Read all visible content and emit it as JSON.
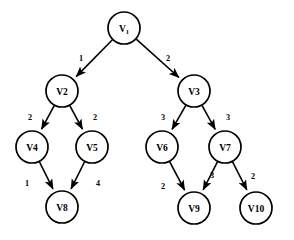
{
  "diagram": {
    "background_color": "#ffffff",
    "stroke_color": "#000000",
    "node_fill_color": "#ffffff",
    "node_radius": 16
  },
  "nodes": [
    {
      "id": "V1",
      "label": "V",
      "subscript": "1",
      "display": "V1",
      "cx": 124,
      "cy": 28,
      "r": 16
    },
    {
      "id": "V2",
      "label": "V2",
      "subscript": "",
      "display": "V2",
      "cx": 62,
      "cy": 91,
      "r": 16
    },
    {
      "id": "V3",
      "label": "V3",
      "subscript": "",
      "display": "V3",
      "cx": 194,
      "cy": 91,
      "r": 16
    },
    {
      "id": "V4",
      "label": "V4",
      "subscript": "",
      "display": "V4",
      "cx": 32,
      "cy": 147,
      "r": 16
    },
    {
      "id": "V5",
      "label": "V5",
      "subscript": "",
      "display": "V5",
      "cx": 92,
      "cy": 147,
      "r": 16
    },
    {
      "id": "V6",
      "label": "V6",
      "subscript": "",
      "display": "V6",
      "cx": 162,
      "cy": 147,
      "r": 16
    },
    {
      "id": "V7",
      "label": "V7",
      "subscript": "",
      "display": "V7",
      "cx": 225,
      "cy": 147,
      "r": 16
    },
    {
      "id": "V8",
      "label": "V8",
      "subscript": "",
      "display": "V8",
      "cx": 62,
      "cy": 207,
      "r": 16
    },
    {
      "id": "V9",
      "label": "V9",
      "subscript": "",
      "display": "V9",
      "cx": 194,
      "cy": 208,
      "r": 16
    },
    {
      "id": "V10",
      "label": "V10",
      "subscript": "",
      "display": "V10",
      "cx": 256,
      "cy": 208,
      "r": 16
    }
  ],
  "edges": [
    {
      "from": "V1",
      "to": "V2",
      "weight": "1",
      "wx": 81,
      "wy": 58
    },
    {
      "from": "V1",
      "to": "V3",
      "weight": "2",
      "wx": 168,
      "wy": 58
    },
    {
      "from": "V2",
      "to": "V4",
      "weight": "2",
      "wx": 30,
      "wy": 117
    },
    {
      "from": "V2",
      "to": "V5",
      "weight": "2",
      "wx": 95,
      "wy": 117
    },
    {
      "from": "V3",
      "to": "V6",
      "weight": "3",
      "wx": 163,
      "wy": 117
    },
    {
      "from": "V3",
      "to": "V7",
      "weight": "3",
      "wx": 228,
      "wy": 117
    },
    {
      "from": "V4",
      "to": "V8",
      "weight": "1",
      "wx": 27,
      "wy": 183
    },
    {
      "from": "V5",
      "to": "V8",
      "weight": "4",
      "wx": 98,
      "wy": 183
    },
    {
      "from": "V6",
      "to": "V9",
      "weight": "2",
      "wx": 163,
      "wy": 186
    },
    {
      "from": "V7",
      "to": "V9",
      "weight": "3",
      "wx": 212,
      "wy": 175
    },
    {
      "from": "V7",
      "to": "V10",
      "weight": "2",
      "wx": 253,
      "wy": 176
    }
  ]
}
